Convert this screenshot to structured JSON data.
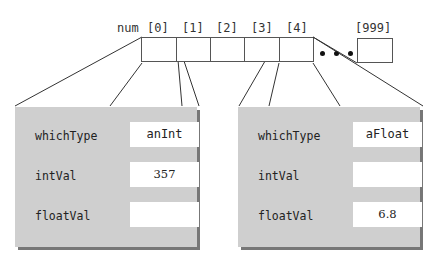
{
  "array": {
    "name": "num",
    "indices": [
      "[0]",
      "[1]",
      "[2]",
      "[3]",
      "[4]"
    ],
    "last_index": "[999]",
    "ellipsis": "• • •"
  },
  "structs": [
    {
      "element": "num[1]",
      "fields": [
        {
          "name": "whichType",
          "value": "anInt"
        },
        {
          "name": "intVal",
          "value": "357"
        },
        {
          "name": "floatVal",
          "value": ""
        }
      ]
    },
    {
      "element": "num[4]",
      "fields": [
        {
          "name": "whichType",
          "value": "aFloat"
        },
        {
          "name": "intVal",
          "value": ""
        },
        {
          "name": "floatVal",
          "value": "6.8"
        }
      ]
    }
  ],
  "colors": {
    "struct_fill": "#cfcfcf",
    "struct_shadow": "#777777",
    "line": "#333333"
  }
}
